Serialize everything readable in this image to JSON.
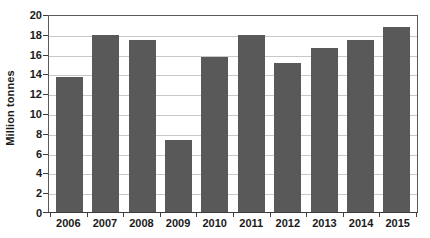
{
  "chart_data": {
    "type": "bar",
    "title": "",
    "subtitle": "",
    "xlabel": "",
    "ylabel": "Million tonnes",
    "categories": [
      "2006",
      "2007",
      "2008",
      "2009",
      "2010",
      "2011",
      "2012",
      "2013",
      "2014",
      "2015"
    ],
    "values": [
      13.6,
      17.9,
      17.4,
      7.3,
      15.7,
      17.9,
      15.1,
      16.6,
      17.4,
      18.7
    ],
    "ylim": [
      0,
      20
    ],
    "ytick_values": [
      0,
      2,
      4,
      6,
      8,
      10,
      12,
      14,
      16,
      18,
      20
    ],
    "ytick_labels": [
      "0",
      "2",
      "4",
      "6",
      "8",
      "10",
      "12",
      "14",
      "16",
      "18",
      "20"
    ],
    "grid": true,
    "grid_axis": "y",
    "legend": false,
    "legend_position": "none",
    "bar_color": "#595959",
    "gridline_color": "#c8c8c8",
    "axis_color": "#3d3d3d",
    "plot_border_color": "#5a5a5a",
    "background_color": "#ffffff"
  },
  "caption": {
    "text": ""
  }
}
